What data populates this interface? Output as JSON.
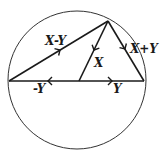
{
  "diagram": {
    "colors": {
      "stroke": "#1a1a1a",
      "circle": "#333333",
      "background": "#ffffff"
    },
    "circle": {
      "cx": 77,
      "cy": 80,
      "r": 69
    },
    "points": {
      "left": [
        9,
        81
      ],
      "center": [
        79,
        81
      ],
      "right": [
        144,
        81
      ],
      "apex": [
        108,
        21
      ]
    },
    "vectors": [
      {
        "id": "x-minus-y",
        "label": "X-Y",
        "from": "left",
        "to": "apex"
      },
      {
        "id": "x",
        "label": "X",
        "from": "apex",
        "to": "center"
      },
      {
        "id": "x-plus-y",
        "label": "X+Y",
        "from": "apex",
        "to": "right"
      },
      {
        "id": "y",
        "label": "Y",
        "from": "center",
        "to": "right"
      },
      {
        "id": "minus-y",
        "label": "-Y",
        "from": "center",
        "to": "left"
      }
    ],
    "labels": {
      "x_minus_y": "X-Y",
      "x": "X",
      "x_plus_y": "X+Y",
      "y": "Y",
      "minus_y": "-Y"
    }
  }
}
